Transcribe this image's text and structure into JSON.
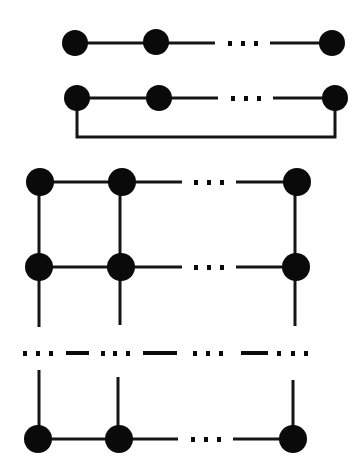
{
  "diagram": {
    "title": "",
    "colors": {
      "node": "#0a0a0a",
      "edge": "#151515",
      "background": "#ffffff"
    },
    "ellipsis": "…",
    "panels": [
      {
        "name": "chain",
        "nodes": 3,
        "label": ""
      },
      {
        "name": "ring",
        "nodes": 3,
        "label": ""
      },
      {
        "name": "grid",
        "rows": 3,
        "cols": 3,
        "label": ""
      }
    ]
  }
}
